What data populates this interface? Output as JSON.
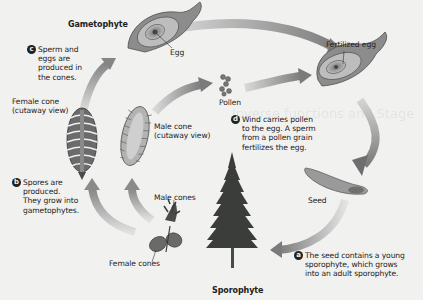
{
  "diagram": {
    "stages": {
      "gametophyte": "Gametophyte",
      "sporophyte": "Sporophyte"
    },
    "labels": {
      "egg": "Egg",
      "fertilized_egg": "Fertilized egg",
      "pollen": "Pollen",
      "female_cone_cutaway": [
        "Female cone",
        "(cutaway view)"
      ],
      "male_cone_cutaway": [
        "Male cone",
        "(cutaway view)"
      ],
      "male_cones": "Male cones",
      "female_cones": "Female cones",
      "seed": "Seed"
    },
    "steps": [
      {
        "marker": "a",
        "lines": [
          "The seed contains a young",
          "sporophyte, which grows",
          "into an adult sporophyte."
        ]
      },
      {
        "marker": "b",
        "lines": [
          "Spores are",
          "produced.",
          "They grow into",
          "gametophytes."
        ]
      },
      {
        "marker": "c",
        "lines": [
          "Sperm and",
          "eggs are",
          "produced in",
          "the cones."
        ]
      },
      {
        "marker": "d",
        "lines": [
          "Wind carries pollen",
          "to the egg. A sperm",
          "from a pollen grain",
          "fertilizes the egg."
        ]
      }
    ],
    "colors": {
      "background": "#f1f1ef",
      "arrow": "#8a8a8a",
      "arrow_light": "#cfcfcf",
      "tree": "#3a3d3a",
      "structure": "#6f6f6f"
    }
  }
}
